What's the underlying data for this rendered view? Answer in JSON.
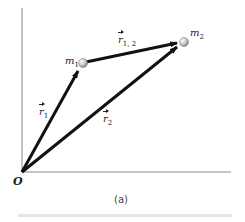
{
  "diagram": {
    "origin_label": "O",
    "caption": "(a)",
    "masses": [
      {
        "label": "m",
        "sub": "1"
      },
      {
        "label": "m",
        "sub": "2"
      }
    ],
    "vectors": [
      {
        "label": "r",
        "sub": "1",
        "from": "O",
        "to": "m1"
      },
      {
        "label": "r",
        "sub": "2",
        "from": "O",
        "to": "m2"
      },
      {
        "label": "r",
        "sub": "1, 2",
        "from": "m1",
        "to": "m2"
      }
    ],
    "colors": {
      "vector": "#111111",
      "axis": "#888888",
      "mass": "#cfcfcf"
    }
  }
}
